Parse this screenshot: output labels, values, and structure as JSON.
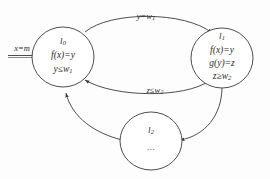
{
  "diagram": {
    "type": "state-transition-diagram",
    "stroke_color": "#3a3a3a",
    "text_color": "#2b2b2b",
    "background_color": "#fdfdfd",
    "entry": {
      "label": "x=m",
      "label_var": "x",
      "label_op": "=",
      "label_val": "m",
      "target": "l0"
    },
    "nodes": [
      {
        "id": "l0",
        "state_label": "l",
        "state_sub": "0",
        "lines": [
          {
            "text": "f(x)=y"
          },
          {
            "text": "y≤w",
            "sub": "1"
          }
        ]
      },
      {
        "id": "l1",
        "state_label": "l",
        "state_sub": "1",
        "lines": [
          {
            "text": "f(x)=y"
          },
          {
            "text": "g(y)=z"
          },
          {
            "text": "z≥w",
            "sub": "2"
          }
        ]
      },
      {
        "id": "l2",
        "state_label": "l",
        "state_sub": "2",
        "lines": [
          {
            "text": "..."
          }
        ]
      }
    ],
    "edges": [
      {
        "id": "e-l0-l1",
        "from": "l0",
        "to": "l1",
        "label": "y=w",
        "label_sub": "1"
      },
      {
        "id": "e-l1-l0",
        "from": "l1",
        "to": "l0",
        "label": "z≤w",
        "label_sub": "2"
      },
      {
        "id": "e-l1-l2",
        "from": "l1",
        "to": "l2",
        "label": ""
      },
      {
        "id": "e-l2-l0",
        "from": "l2",
        "to": "l0",
        "label": ""
      }
    ]
  }
}
